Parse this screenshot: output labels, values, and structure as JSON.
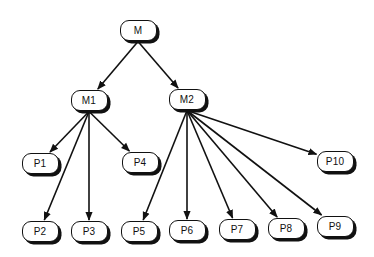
{
  "diagram": {
    "type": "tree",
    "colors": {
      "line": "#111111",
      "node_fill": "#ffffff",
      "shadow": "#111111",
      "background": "#ffffff"
    },
    "nodes": [
      {
        "id": "M",
        "label": "M",
        "cx": 138,
        "cy": 30
      },
      {
        "id": "M1",
        "label": "M1",
        "cx": 89,
        "cy": 100
      },
      {
        "id": "M2",
        "label": "M2",
        "cx": 187,
        "cy": 99
      },
      {
        "id": "P1",
        "label": "P1",
        "cx": 40,
        "cy": 163
      },
      {
        "id": "P4",
        "label": "P4",
        "cx": 140,
        "cy": 162
      },
      {
        "id": "P10",
        "label": "P10",
        "cx": 335,
        "cy": 161
      },
      {
        "id": "P2",
        "label": "P2",
        "cx": 40,
        "cy": 231
      },
      {
        "id": "P3",
        "label": "P3",
        "cx": 89,
        "cy": 231
      },
      {
        "id": "P5",
        "label": "P5",
        "cx": 139,
        "cy": 231
      },
      {
        "id": "P6",
        "label": "P6",
        "cx": 187,
        "cy": 230
      },
      {
        "id": "P7",
        "label": "P7",
        "cx": 237,
        "cy": 229
      },
      {
        "id": "P8",
        "label": "P8",
        "cx": 286,
        "cy": 228
      },
      {
        "id": "P9",
        "label": "P9",
        "cx": 335,
        "cy": 226
      }
    ],
    "edges": [
      {
        "from": "M",
        "to": "M1"
      },
      {
        "from": "M",
        "to": "M2"
      },
      {
        "from": "M1",
        "to": "P1"
      },
      {
        "from": "M1",
        "to": "P2"
      },
      {
        "from": "M1",
        "to": "P3"
      },
      {
        "from": "M1",
        "to": "P4"
      },
      {
        "from": "M2",
        "to": "P5"
      },
      {
        "from": "M2",
        "to": "P6"
      },
      {
        "from": "M2",
        "to": "P7"
      },
      {
        "from": "M2",
        "to": "P8"
      },
      {
        "from": "M2",
        "to": "P9"
      },
      {
        "from": "M2",
        "to": "P10"
      }
    ]
  }
}
